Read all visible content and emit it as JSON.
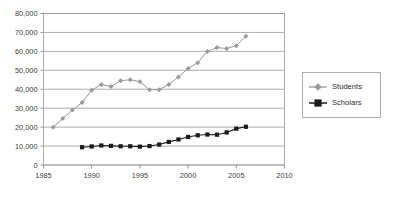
{
  "chart_data": {
    "type": "line",
    "title": "",
    "subtitle": "",
    "xlabel": "",
    "ylabel": "",
    "xlim": [
      1985,
      2010
    ],
    "ylim": [
      0,
      80000
    ],
    "grid": true,
    "legend_position": "right",
    "x_ticks": [
      "1985",
      "1990",
      "1995",
      "2000",
      "2005",
      "2010"
    ],
    "x_tick_values": [
      1985,
      1990,
      1995,
      2000,
      2005,
      2010
    ],
    "y_ticks": [
      "0",
      "10,000",
      "20,000",
      "30,000",
      "40,000",
      "50,000",
      "60,000",
      "70,000",
      "80,000"
    ],
    "y_tick_values": [
      0,
      10000,
      20000,
      30000,
      40000,
      50000,
      60000,
      70000,
      80000
    ],
    "series": [
      {
        "name": "Students",
        "color": "#9a9a9a",
        "marker": "diamond",
        "x": [
          1986,
          1987,
          1988,
          1989,
          1990,
          1991,
          1992,
          1993,
          1994,
          1995,
          1996,
          1997,
          1998,
          1999,
          2000,
          2001,
          2002,
          2003,
          2004,
          2005,
          2006
        ],
        "values": [
          20000,
          24500,
          29000,
          33000,
          39500,
          42500,
          41500,
          44500,
          45000,
          44000,
          39800,
          39800,
          42500,
          46500,
          51000,
          54000,
          60000,
          62000,
          61500,
          63000,
          68000
        ]
      },
      {
        "name": "Scholars",
        "color": "#1a1a1a",
        "marker": "square",
        "x": [
          1989,
          1990,
          1991,
          1992,
          1993,
          1994,
          1995,
          1996,
          1997,
          1998,
          1999,
          2000,
          2001,
          2002,
          2003,
          2004,
          2005,
          2006
        ],
        "values": [
          9400,
          9800,
          10300,
          10100,
          9900,
          9900,
          9700,
          10000,
          10800,
          12200,
          13500,
          14800,
          15700,
          16100,
          16000,
          17200,
          19200,
          20200
        ]
      }
    ]
  },
  "legend": {
    "entries": [
      {
        "label": "Students"
      },
      {
        "label": "Scholars"
      }
    ]
  },
  "colors": {
    "students": "#9a9a9a",
    "scholars": "#1a1a1a",
    "grid": "#9a9a9a",
    "axis": "#8a8a8a",
    "text": "#404040",
    "background": "#ffffff"
  }
}
